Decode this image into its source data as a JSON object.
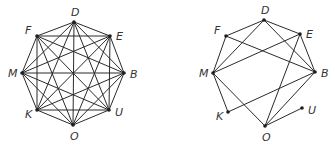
{
  "graphs": [
    {
      "name": "complete-graph",
      "nodes": [
        "D",
        "E",
        "B",
        "U",
        "O",
        "K",
        "M",
        "F"
      ],
      "edges": "all-pairs"
    },
    {
      "name": "subgraph",
      "nodes": [
        "D",
        "E",
        "B",
        "U",
        "O",
        "K",
        "M",
        "F"
      ],
      "edges": [
        [
          "F",
          "D"
        ],
        [
          "D",
          "E"
        ],
        [
          "D",
          "M"
        ],
        [
          "D",
          "B"
        ],
        [
          "F",
          "M"
        ],
        [
          "F",
          "B"
        ],
        [
          "E",
          "M"
        ],
        [
          "E",
          "B"
        ],
        [
          "E",
          "O"
        ],
        [
          "M",
          "K"
        ],
        [
          "M",
          "O"
        ],
        [
          "B",
          "K"
        ],
        [
          "B",
          "O"
        ],
        [
          "O",
          "U"
        ]
      ]
    }
  ]
}
